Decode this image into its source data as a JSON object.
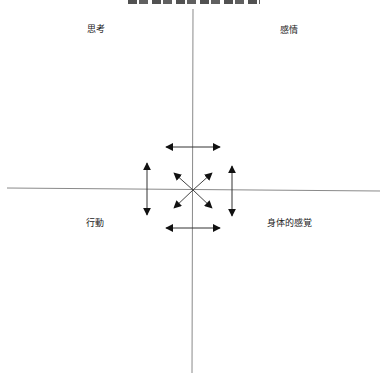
{
  "diagram": {
    "type": "quadrant-diagram",
    "quadrants": {
      "top_left": {
        "label": "思考"
      },
      "top_right": {
        "label": "感情"
      },
      "bottom_left": {
        "label": "行動"
      },
      "bottom_right": {
        "label": "身体的感覚"
      }
    },
    "axes": {
      "horizontal": {
        "x1": 7,
        "y1": 188,
        "x2": 380,
        "y2": 191
      },
      "vertical": {
        "x1": 193,
        "y1": 9,
        "x2": 192,
        "y2": 373
      }
    },
    "arrows": [
      {
        "name": "top-horizontal-double-arrow",
        "x1": 166,
        "y1": 147,
        "x2": 220,
        "y2": 147
      },
      {
        "name": "bottom-horizontal-double-arrow",
        "x1": 166,
        "y1": 228,
        "x2": 220,
        "y2": 228
      },
      {
        "name": "left-vertical-double-arrow",
        "x1": 147,
        "y1": 163,
        "x2": 147,
        "y2": 215
      },
      {
        "name": "right-vertical-double-arrow",
        "x1": 232,
        "y1": 166,
        "x2": 232,
        "y2": 216
      },
      {
        "name": "diagonal-arrow-up-left",
        "x1": 193,
        "y1": 190,
        "x2": 174,
        "y2": 173
      },
      {
        "name": "diagonal-arrow-up-right",
        "x1": 193,
        "y1": 190,
        "x2": 212,
        "y2": 173
      },
      {
        "name": "diagonal-arrow-down-left",
        "x1": 193,
        "y1": 190,
        "x2": 174,
        "y2": 208
      },
      {
        "name": "diagonal-arrow-down-right",
        "x1": 193,
        "y1": 190,
        "x2": 212,
        "y2": 208
      }
    ],
    "colors": {
      "axis": "#8a8a8a",
      "arrow": "#111111",
      "text": "#222222",
      "background": "#ffffff"
    }
  }
}
